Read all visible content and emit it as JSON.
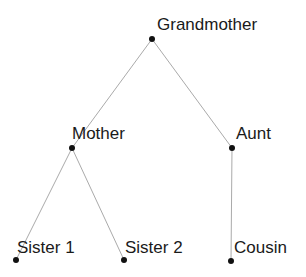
{
  "diagram": {
    "type": "family-tree",
    "background_color": "#ffffff",
    "node_color": "#111111",
    "edge_color": "#aaaaaa",
    "label_color": "#1a1a1a",
    "width": 306,
    "height": 277,
    "nodes": [
      {
        "id": "grandmother",
        "label": "Grandmother",
        "x": 152,
        "y": 39,
        "label_x": 157,
        "label_y": 16
      },
      {
        "id": "mother",
        "label": "Mother",
        "x": 72,
        "y": 148,
        "label_x": 72,
        "label_y": 125
      },
      {
        "id": "aunt",
        "label": "Aunt",
        "x": 232,
        "y": 148,
        "label_x": 236,
        "label_y": 125
      },
      {
        "id": "sister1",
        "label": "Sister 1",
        "x": 16,
        "y": 260,
        "label_x": 17,
        "label_y": 239
      },
      {
        "id": "sister2",
        "label": "Sister 2",
        "x": 124,
        "y": 260,
        "label_x": 125,
        "label_y": 239
      },
      {
        "id": "cousin",
        "label": "Cousin",
        "x": 231,
        "y": 261,
        "label_x": 234,
        "label_y": 239
      }
    ],
    "edges": [
      {
        "id": "grandmother-mother",
        "from": "grandmother",
        "to": "mother",
        "x1": 152,
        "y1": 39,
        "x2": 72,
        "y2": 148
      },
      {
        "id": "grandmother-aunt",
        "from": "grandmother",
        "to": "aunt",
        "x1": 152,
        "y1": 39,
        "x2": 232,
        "y2": 148
      },
      {
        "id": "mother-sister1",
        "from": "mother",
        "to": "sister1",
        "x1": 72,
        "y1": 148,
        "x2": 16,
        "y2": 260
      },
      {
        "id": "mother-sister2",
        "from": "mother",
        "to": "sister2",
        "x1": 72,
        "y1": 148,
        "x2": 124,
        "y2": 260
      },
      {
        "id": "aunt-cousin",
        "from": "aunt",
        "to": "cousin",
        "x1": 232,
        "y1": 148,
        "x2": 231,
        "y2": 261
      }
    ]
  }
}
